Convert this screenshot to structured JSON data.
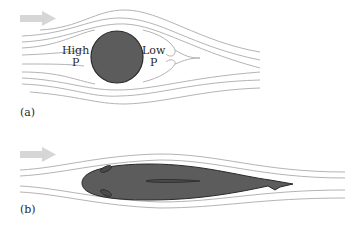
{
  "figure": {
    "panel_a": {
      "label": "(a)",
      "object": "cylinder",
      "high_pressure_label_line1": "High",
      "high_pressure_label_line2": "P",
      "low_pressure_label_line1": "Low",
      "low_pressure_label_line2": "P",
      "flow_direction": "left-to-right"
    },
    "panel_b": {
      "label": "(b)",
      "object": "streamlined fish",
      "flow_direction": "left-to-right"
    },
    "colors": {
      "object_fill": "#5a5a5a",
      "object_stroke": "#2a2a2a",
      "streamline": "#b0b0b0",
      "arrow": "#d3d3d3",
      "text": "#2a2a2a"
    }
  }
}
